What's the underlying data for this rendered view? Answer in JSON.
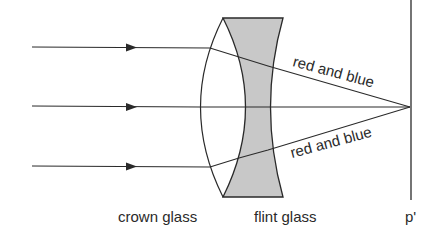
{
  "diagram": {
    "labels": {
      "crown": "crown glass",
      "flint": "flint glass",
      "focus": "p'",
      "ray_top": "red and blue",
      "ray_bottom": "red and blue"
    },
    "colors": {
      "line": "#2a2a2a",
      "flint_fill": "#c8c8c8",
      "background": "#ffffff"
    },
    "rays": [
      {
        "y": 47,
        "label": "incoming-ray-top"
      },
      {
        "y": 107,
        "label": "incoming-ray-middle"
      },
      {
        "y": 166,
        "label": "incoming-ray-bottom"
      }
    ],
    "focal_point": {
      "x": 410,
      "y": 107
    }
  }
}
